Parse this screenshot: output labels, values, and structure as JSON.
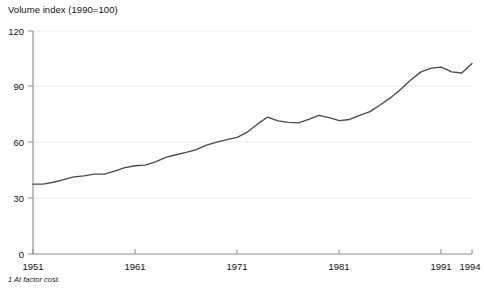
{
  "chart_data": {
    "type": "line",
    "title": "Volume index (1990=100)",
    "xlabel": "",
    "ylabel": "Volume index (1990=100)",
    "footnote": "1 At factor cost.",
    "xlim": [
      1951,
      1994
    ],
    "ylim": [
      0,
      120
    ],
    "grid": true,
    "legend": "none",
    "yticks": [
      0,
      30,
      60,
      90,
      120
    ],
    "ytick_labels": [
      "0",
      "30",
      "60",
      "90",
      "120"
    ],
    "xticks": [
      1951,
      1961,
      1971,
      1981,
      1991,
      1994
    ],
    "xtick_labels": [
      "1951",
      "1961",
      "1971",
      "1981",
      "1991",
      "1994"
    ],
    "series": [
      {
        "name": "Volume index",
        "color": "#4a4a4a",
        "x": [
          1951,
          1952,
          1953,
          1954,
          1955,
          1956,
          1957,
          1958,
          1959,
          1960,
          1961,
          1962,
          1963,
          1964,
          1965,
          1966,
          1967,
          1968,
          1969,
          1970,
          1971,
          1972,
          1973,
          1974,
          1975,
          1976,
          1977,
          1978,
          1979,
          1980,
          1981,
          1982,
          1983,
          1984,
          1985,
          1986,
          1987,
          1988,
          1989,
          1990,
          1991,
          1992,
          1993,
          1994
        ],
        "values": [
          37.6,
          37.6,
          38.6,
          40.0,
          41.5,
          42.0,
          43.0,
          43.0,
          44.6,
          46.5,
          47.5,
          47.8,
          49.6,
          52.0,
          53.4,
          54.7,
          56.2,
          58.6,
          60.2,
          61.5,
          62.8,
          65.6,
          70.0,
          73.7,
          71.6,
          70.8,
          70.6,
          72.5,
          74.6,
          73.4,
          71.8,
          72.4,
          74.6,
          76.6,
          80.2,
          84.0,
          88.5,
          93.6,
          98.0,
          100.0,
          100.6,
          98.0,
          97.4,
          102.5
        ]
      }
    ]
  },
  "axis": {
    "title_text": "Volume index (1990=100)",
    "footnote_text": "1 At factor cost."
  }
}
